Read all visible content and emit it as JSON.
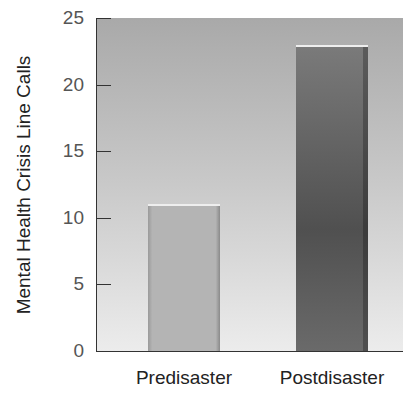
{
  "chart_data": {
    "type": "bar",
    "title": "",
    "xlabel": "",
    "ylabel": "Mental Health Crisis Line Calls",
    "categories": [
      "Predisaster",
      "Postdisaster"
    ],
    "values": [
      11,
      23
    ],
    "ylim": [
      0,
      25
    ],
    "yticks": [
      "0",
      "5",
      "10",
      "15",
      "20",
      "25"
    ],
    "grid": false,
    "legend": null
  }
}
